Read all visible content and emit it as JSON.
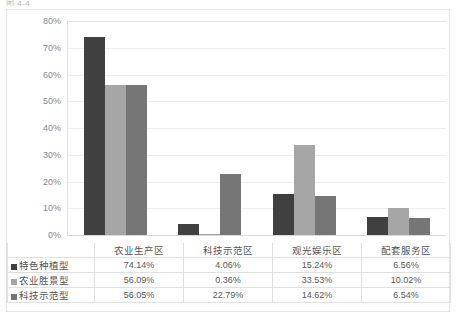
{
  "top_fragment": "图 4-4 ",
  "chart_data": {
    "type": "bar",
    "title": "",
    "subtitle": "",
    "xlabel": "",
    "ylabel": "",
    "ylim": [
      0,
      0.8
    ],
    "grid": true,
    "legend_position": "data-table-left",
    "value_format": "percent",
    "categories": [
      "农业生产区",
      "科技示范区",
      "观光娱乐区",
      "配套服务区"
    ],
    "y_ticks": [
      "80%",
      "70%",
      "60%",
      "50%",
      "40%",
      "30%",
      "20%",
      "10%",
      "0%"
    ],
    "y_tick_values": [
      80,
      70,
      60,
      50,
      40,
      30,
      20,
      10,
      0
    ],
    "series": [
      {
        "name": "特色种植型",
        "color": "#404040",
        "values": [
          74.14,
          4.06,
          15.24,
          6.56
        ],
        "labels": [
          "74.14%",
          "56.09%",
          "56.05%"
        ]
      },
      {
        "name": "农业胜景型",
        "color": "#a6a6a6",
        "values": [
          56.09,
          0.36,
          33.53,
          10.02
        ],
        "labels": []
      },
      {
        "name": "科技示范型",
        "color": "#767676",
        "values": [
          56.05,
          22.79,
          14.62,
          6.54
        ],
        "labels": []
      }
    ],
    "table_rows": [
      {
        "label": "特色种植型",
        "color": "#404040",
        "cells": [
          "74.14%",
          "4.06%",
          "15.24%",
          "6.56%"
        ]
      },
      {
        "label": "农业胜景型",
        "color": "#a6a6a6",
        "cells": [
          "56.09%",
          "0.36%",
          "33.53%",
          "10.02%"
        ]
      },
      {
        "label": "科技示范型",
        "color": "#767676",
        "cells": [
          "56.05%",
          "22.79%",
          "14.62%",
          "6.54%"
        ]
      }
    ]
  }
}
